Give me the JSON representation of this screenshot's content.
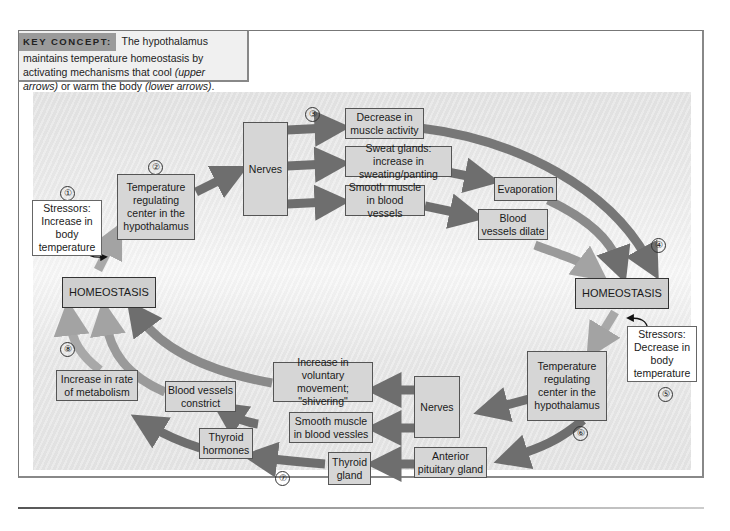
{
  "key_concept": {
    "label": "KEY CONCEPT:",
    "text_part1": "The hypothalamus maintains temperature homeostasis by activating mechanisms that cool ",
    "upper_arrows": "(upper arrows)",
    "text_part2": " or warm the body ",
    "lower_arrows": "(lower arrows)",
    "text_end": "."
  },
  "step_numbers": [
    "①",
    "②",
    "③",
    "④",
    "⑤",
    "⑥",
    "⑦",
    "⑧"
  ],
  "cooling": {
    "stressor": "Stressors: Increase in body temperature",
    "center": "Temperature regulating center in the hypothalamus",
    "nerves": "Nerves",
    "effects": [
      "Decrease in muscle activity",
      "Sweat glands: increase in sweating/panting",
      "Smooth muscle in blood vessels"
    ],
    "evaporation": "Evaporation",
    "dilate": "Blood vessels dilate"
  },
  "warming": {
    "stressor": "Stressors: Decrease in body temperature",
    "center": "Temperature regulating center in the hypothalamus",
    "nerves": "Nerves",
    "shivering": "Increase in voluntary movement; \"shivering\"",
    "smooth_muscle": "Smooth muscle in blood vessles",
    "anterior_pituitary": "Anterior pituitary gland",
    "thyroid_gland": "Thyroid gland",
    "thyroid_hormones": "Thyroid hormones",
    "constrict": "Blood vessels constrict",
    "metabolism": "Increase in rate of metabolism"
  },
  "homeostasis_left": "HOMEOSTASIS",
  "homeostasis_right": "HOMEOSTASIS",
  "colors": {
    "box": "#d6d6d6",
    "arrow_dark": "#6e6e6e",
    "arrow_light": "#a9a9a9",
    "key_label_bg": "#9a9a9a"
  }
}
